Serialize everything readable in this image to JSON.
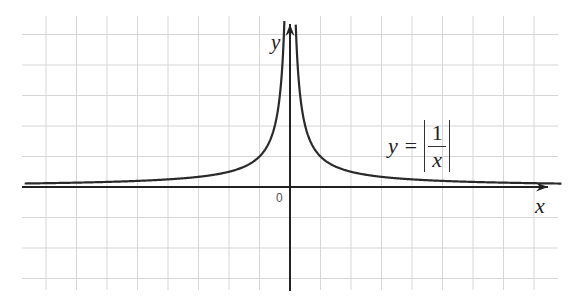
{
  "chart_data": {
    "type": "line",
    "title": "",
    "function": "y = |1/x|",
    "annotation": {
      "text_lhs": "y =",
      "numerator": "1",
      "denominator": "x"
    },
    "xlabel": "x",
    "ylabel": "y",
    "origin_label": "0",
    "xlim": [
      -8.7,
      8.9
    ],
    "ylim": [
      -3.4,
      5.3
    ],
    "grid": true,
    "grid_spacing": 1,
    "legend": null,
    "series": [
      {
        "name": "y=|1/x|",
        "x": [
          -8.7,
          -6,
          -4,
          -3,
          -2,
          -1.5,
          -1,
          -0.75,
          -0.5,
          -0.3,
          -0.2,
          0.2,
          0.3,
          0.5,
          0.75,
          1,
          1.5,
          2,
          3,
          4,
          6,
          8.7
        ],
        "y": [
          0.115,
          0.167,
          0.25,
          0.333,
          0.5,
          0.667,
          1,
          1.333,
          2,
          3.333,
          5,
          5,
          3.333,
          2,
          1.333,
          1,
          0.667,
          0.5,
          0.333,
          0.25,
          0.167,
          0.115
        ]
      }
    ]
  },
  "labels": {
    "x_axis": "x",
    "y_axis": "y",
    "origin": "0",
    "eq_lhs": "y =",
    "eq_num": "1",
    "eq_den": "x"
  },
  "colors": {
    "grid": "#d4d4d4",
    "axis": "#222222",
    "curve": "#2a2a2a",
    "background": "#ffffff"
  }
}
